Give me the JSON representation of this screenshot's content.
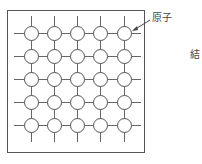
{
  "diagram": {
    "labels": {
      "atom": "原子",
      "right_cut": "結"
    },
    "grid": {
      "rows": 5,
      "cols": 5,
      "x_centers": [
        31,
        54,
        77,
        100,
        124
      ],
      "y_centers": [
        33,
        56,
        79,
        102,
        125
      ],
      "radius": 7
    },
    "frame": {
      "x": 7,
      "y": 10,
      "width": 137,
      "height": 142
    },
    "colors": {
      "stroke": "#555555",
      "background": "#ffffff"
    }
  }
}
